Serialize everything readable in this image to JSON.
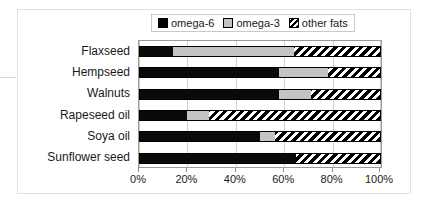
{
  "chart_data": {
    "type": "bar",
    "orientation": "horizontal",
    "stacked": true,
    "stack_mode": "percent",
    "title": "",
    "subtitle": "",
    "xlabel": "",
    "ylabel": "",
    "xlim": [
      0,
      100
    ],
    "grid": true,
    "legend_position": "top-center",
    "categories": [
      "Flaxseed",
      "Hempseed",
      "Walnuts",
      "Rapeseed oil",
      "Soya oil",
      "Sunflower seed"
    ],
    "tick_labels": [
      "0%",
      "20%",
      "40%",
      "60%",
      "80%",
      "100%"
    ],
    "tick_values": [
      0,
      20,
      40,
      60,
      80,
      100
    ],
    "series": [
      {
        "name": "omega-6",
        "color": "#000000",
        "pattern": "solid",
        "values": [
          14,
          58,
          58,
          20,
          50,
          65
        ]
      },
      {
        "name": "omega-3",
        "color": "#c4c4c4",
        "pattern": "solid",
        "values": [
          50,
          20,
          13,
          9,
          6,
          0
        ]
      },
      {
        "name": "other fats",
        "color": "#ffffff",
        "pattern": "diagonal-hatch",
        "values": [
          36,
          22,
          29,
          71,
          44,
          35
        ]
      }
    ]
  },
  "legend": {
    "items": [
      {
        "label": "omega-6",
        "swatch": "swatch-solid-black"
      },
      {
        "label": "omega-3",
        "swatch": "swatch-solid-gray"
      },
      {
        "label": "other fats",
        "swatch": "swatch-hatched"
      }
    ]
  },
  "colors": {
    "omega6": "#000000",
    "omega3": "#c4c4c4",
    "other_fats": "#ffffff",
    "plot_border": "#9a9a9a",
    "gridline": "#d0d0d0",
    "frame": "#e2e2e2",
    "text": "#1a1a1a",
    "background": "#ffffff"
  }
}
